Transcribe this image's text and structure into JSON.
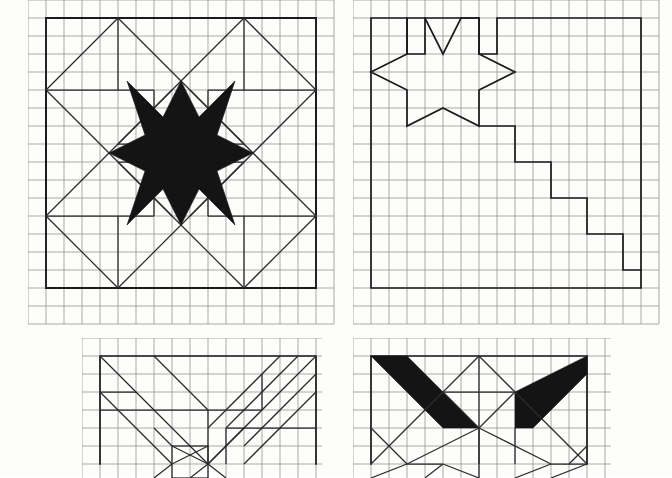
{
  "page": {
    "background_color": "#fdfdfc",
    "grid_color": "#9a9a9a",
    "ink_color": "#1b1b1b",
    "fill_color": "#141414",
    "cell_size_px": 18,
    "width_px": 672,
    "height_px": 475
  },
  "figures": [
    {
      "id": "figure-top-left",
      "name": "eight-point-star-with-diagonal-rays",
      "label": "",
      "origin": {
        "x": 28,
        "y": 0
      },
      "grid": {
        "cols": 17,
        "rows": 18,
        "cell": 18
      },
      "block": {
        "col_start": 1,
        "row_start": 1,
        "cols": 15,
        "rows": 15
      },
      "filled": true,
      "description": "Solid black eight-pointed star centered in a square block, with outlined diagonal ray bands radiating to the four corners."
    },
    {
      "id": "figure-top-right",
      "name": "eight-point-star-with-staircase",
      "label": "",
      "origin": {
        "x": 353,
        "y": 0
      },
      "grid": {
        "cols": 17,
        "rows": 18,
        "cell": 18
      },
      "block": {
        "col_start": 1,
        "row_start": 1,
        "cols": 15,
        "rows": 15
      },
      "filled": false,
      "description": "Outlined eight-pointed star in the upper-left of the block, joined to a descending staircase of two-cell steps leading to the lower-right corner."
    },
    {
      "id": "figure-bottom-left",
      "name": "chevron-rays-with-center-square",
      "label": "",
      "origin": {
        "x": 82,
        "y": 338
      },
      "grid": {
        "cols": 15,
        "rows": 8,
        "cell": 18
      },
      "block": {
        "col_start": 1,
        "row_start": 1,
        "cols": 13,
        "rows": 7
      },
      "filled": false,
      "description": "Outlined V-shaped chevron of nested diagonal bands converging on a small central square, partially cropped at the bottom edge of the sheet."
    },
    {
      "id": "figure-bottom-right",
      "name": "solid-chevron-with-diamond-lattice",
      "label": "",
      "origin": {
        "x": 353,
        "y": 338
      },
      "grid": {
        "cols": 16,
        "rows": 8,
        "cell": 18
      },
      "block": {
        "col_start": 1,
        "row_start": 1,
        "cols": 14,
        "rows": 7
      },
      "filled": true,
      "description": "Two solid black diagonal bars forming a wide chevron above an outlined diamond and triangle lattice, partially cropped at the bottom edge of the sheet."
    }
  ],
  "legend": {
    "solid_note": "",
    "outline_note": ""
  }
}
